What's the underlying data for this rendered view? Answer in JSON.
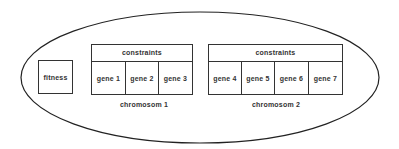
{
  "diagram": {
    "individual": {
      "fitness_label": "fitness"
    },
    "chromosomes": [
      {
        "label": "chromosom 1",
        "constraints_label": "constraints",
        "genes": [
          "gene 1",
          "gene 2",
          "gene 3"
        ]
      },
      {
        "label": "chromosom 2",
        "constraints_label": "constraints",
        "genes": [
          "gene 4",
          "gene 5",
          "gene 6",
          "gene 7"
        ]
      }
    ]
  }
}
